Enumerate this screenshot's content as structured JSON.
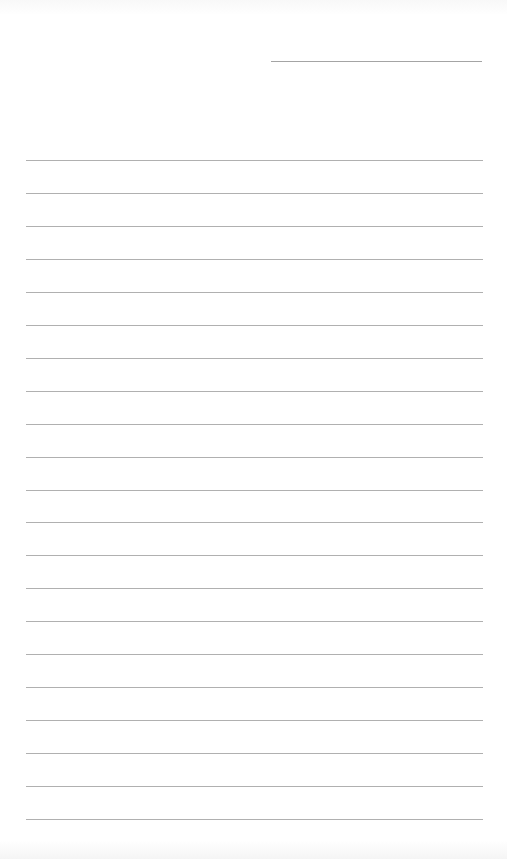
{
  "document": {
    "type": "lined-paper-form",
    "header_line": {
      "x": 271,
      "y": 61,
      "width": 211
    },
    "ruled_lines": {
      "count": 21,
      "x": 26,
      "width": 457,
      "first_y": 160,
      "spacing": 32.95,
      "color": "#b0b0b0"
    },
    "content": []
  }
}
